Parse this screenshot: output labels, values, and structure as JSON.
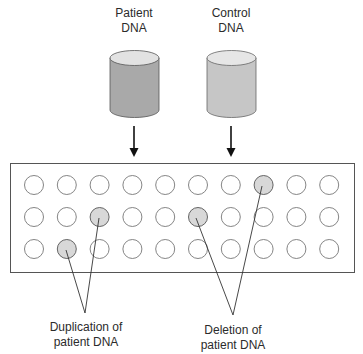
{
  "sources": [
    {
      "id": "patient",
      "label_line1": "Patient",
      "label_line2": "DNA",
      "body_color": "#a9a9a9",
      "top_color": "#e2e2e2"
    },
    {
      "id": "control",
      "label_line1": "Control",
      "label_line2": "DNA",
      "body_color": "#c6c6c6",
      "top_color": "#e6e6e6"
    }
  ],
  "array": {
    "rows": 3,
    "columns": 10,
    "highlight_color": "#d8d8d8",
    "highlighted_cells": [
      {
        "row": 1,
        "col": 8,
        "meaning": "deletion"
      },
      {
        "row": 2,
        "col": 3,
        "meaning": "duplication"
      },
      {
        "row": 2,
        "col": 6,
        "meaning": "deletion"
      },
      {
        "row": 3,
        "col": 2,
        "meaning": "duplication"
      }
    ]
  },
  "annotations": {
    "duplication": {
      "line1": "Duplication of",
      "line2": "patient DNA"
    },
    "deletion": {
      "line1": "Deletion of",
      "line2": "patient DNA"
    }
  }
}
